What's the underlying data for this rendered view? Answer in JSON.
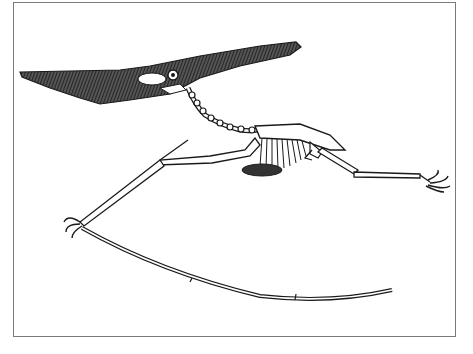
{
  "image": {
    "subject": "Pteranodon skeleton illustration",
    "style": "black-and-white line engraving",
    "frame": {
      "border_color": "#7a7a7a",
      "background": "#ffffff"
    },
    "ink_color": "#1a1a1a",
    "parts": [
      {
        "name": "skull",
        "description": "long crested skull with pointed beak and eye socket"
      },
      {
        "name": "neck",
        "description": "curved vertebral column"
      },
      {
        "name": "ribcage",
        "description": "torso with ribs and sternum"
      },
      {
        "name": "left-wing",
        "description": "extended wing bones ending in long curved finger"
      },
      {
        "name": "hind-limb",
        "description": "leg extended to the right with clawed foot"
      }
    ]
  }
}
